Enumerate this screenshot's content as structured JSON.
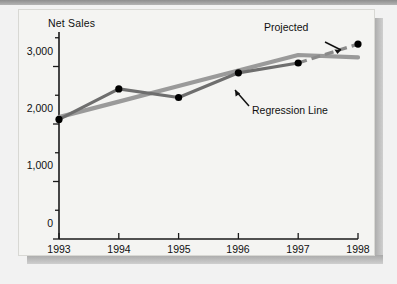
{
  "chart_data": {
    "type": "line",
    "title": "",
    "ylabel": "Net Sales",
    "xlabel": "",
    "x": [
      1993,
      1994,
      1995,
      1996,
      1997,
      1998
    ],
    "xtick_labels": [
      "1993",
      "1994",
      "1995",
      "1996",
      "1997",
      "1998"
    ],
    "ytick_labels": [
      "0",
      "1,000",
      "2,000",
      "3,000"
    ],
    "ytick_values": [
      0,
      1000,
      2000,
      3000
    ],
    "ylim": [
      0,
      3600
    ],
    "xlim": [
      1993,
      1998
    ],
    "grid": false,
    "legend_position": "none",
    "series": [
      {
        "name": "Net Sales (actual)",
        "style": "solid-with-markers",
        "color": "#6e6e6e",
        "marker": "filled-circle",
        "marker_color": "#000000",
        "values": [
          2080,
          2610,
          2460,
          2890,
          3060,
          null
        ],
        "x": [
          1993,
          1994,
          1995,
          1996,
          1997,
          1998
        ]
      },
      {
        "name": "Projected",
        "style": "dashed",
        "color": "#8a8a8a",
        "marker": "filled-circle",
        "marker_color": "#000000",
        "values": [
          3060,
          3390
        ],
        "x": [
          1997,
          1998
        ]
      },
      {
        "name": "Regression Line",
        "style": "solid-thick",
        "color": "#9a9a9a",
        "marker": "none",
        "values": [
          2120,
          2390,
          2660,
          2930,
          3200,
          3160
        ],
        "x": [
          1993,
          1994,
          1995,
          1996,
          1997,
          1998
        ]
      }
    ],
    "annotations": [
      {
        "label": "Projected",
        "name": "projected-label"
      },
      {
        "label": "Regression Line",
        "name": "regression-line-label"
      }
    ]
  },
  "colors": {
    "page_background": "#f2f2f2",
    "card_background": "#f4f4f2",
    "axis": "#1a1a1a",
    "series_actual": "#6e6e6e",
    "series_projected": "#8a8a8a",
    "series_regression": "#9a9a9a",
    "marker": "#000000",
    "text": "#101010"
  }
}
